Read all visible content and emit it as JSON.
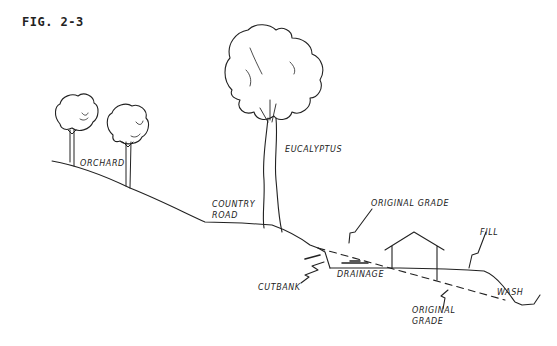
{
  "figure": {
    "title": "FIG. 2-3"
  },
  "labels": {
    "orchard": "ORCHARD",
    "eucalyptus": "EUCALYPTUS",
    "country_road_line1": "COUNTRY",
    "country_road_line2": "ROAD",
    "original_grade_top": "ORIGINAL GRADE",
    "fill": "FILL",
    "cutbank": "CUTBANK",
    "drainage": "DRAINAGE",
    "original_grade_bottom_line1": "ORIGINAL",
    "original_grade_bottom_line2": "GRADE",
    "wash": "WASH"
  },
  "colors": {
    "ink": "#222222",
    "background": "#ffffff"
  }
}
